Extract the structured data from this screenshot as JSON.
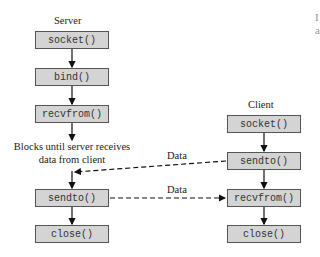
{
  "server": {
    "title": "Server",
    "steps": [
      "socket()",
      "bind()",
      "recvfrom()",
      "sendto()",
      "close()"
    ],
    "block_note_line1": "Blocks until server receives",
    "block_note_line2": "data from client"
  },
  "client": {
    "title": "Client",
    "steps": [
      "socket()",
      "sendto()",
      "recvfrom()",
      "close()"
    ]
  },
  "messages": [
    {
      "label": "Data",
      "from": "client.sendto()",
      "to": "server (after recvfrom)"
    },
    {
      "label": "Data",
      "from": "server.sendto()",
      "to": "client.recvfrom()"
    }
  ],
  "clipped_edge_text": [
    "I",
    "a"
  ]
}
